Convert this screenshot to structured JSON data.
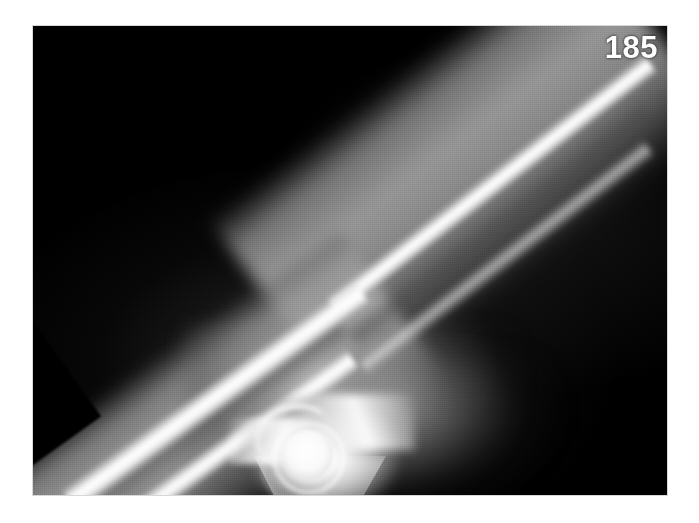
{
  "figure": {
    "number": "185",
    "number_color": "#ffffff",
    "position": "top-right"
  },
  "page": {
    "background_color": "#ffffff",
    "width": 699,
    "height": 523
  },
  "radiograph": {
    "background_color": "#000000",
    "frame": {
      "left": 33,
      "top": 26,
      "width": 634,
      "height": 469
    },
    "modality": "x-ray",
    "body_part": "elbow",
    "projection": "lateral",
    "position": "flexed",
    "orientation": "forearm upper-left, humerus upper-right, joint at bottom-center",
    "structures": [
      {
        "name": "ulna",
        "region": "forearm",
        "appearance": "bright cortical shaft, posterior"
      },
      {
        "name": "radius",
        "region": "forearm",
        "appearance": "bright cortical shaft, anterior"
      },
      {
        "name": "humerus",
        "region": "upper-arm",
        "appearance": "long diagonal bright shaft to upper right"
      },
      {
        "name": "capitellum",
        "region": "joint",
        "appearance": "bright rounded ring end-on"
      },
      {
        "name": "olecranon",
        "region": "joint",
        "appearance": "hook of proximal ulna"
      },
      {
        "name": "coronoid-process",
        "region": "joint",
        "appearance": "anterior ulnar flare"
      },
      {
        "name": "soft-tissue-envelope",
        "region": "whole-limb",
        "appearance": "grey halo around bone"
      },
      {
        "name": "collimation-edge",
        "region": "upper-left",
        "appearance": "sharp diagonal film cut-off"
      }
    ]
  }
}
